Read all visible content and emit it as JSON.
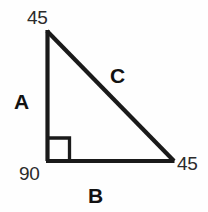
{
  "figure": {
    "kind": "right-triangle-diagram",
    "stroke_color": "#1a1a1a",
    "background_color": "#fefefe",
    "stroke_width": 4,
    "right_angle_marker_size": 22,
    "vertices": {
      "apex": {
        "x": 47,
        "y": 31
      },
      "right_angle": {
        "x": 47,
        "y": 161
      },
      "base_right": {
        "x": 174,
        "y": 161
      }
    }
  },
  "angles": {
    "top": "45",
    "bottom_right": "45",
    "bottom_left": "90"
  },
  "sides": {
    "vertical": "A",
    "horizontal": "B",
    "hypotenuse": "C"
  },
  "chart_data": {
    "type": "table",
    "title": "",
    "categories": [
      "top angle",
      "bottom-right angle",
      "bottom-left angle"
    ],
    "values": [
      45,
      45,
      90
    ],
    "annotations": [
      "A",
      "B",
      "C"
    ],
    "xlabel": "",
    "ylabel": ""
  }
}
